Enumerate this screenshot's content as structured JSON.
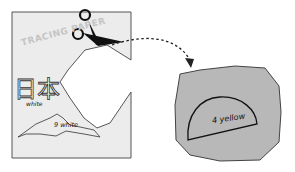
{
  "tracing_paper": {
    "label": "TRACING PAPER",
    "kanji": "日本",
    "kanji_label": "white",
    "mountain_label": "9 white"
  },
  "cut_piece": {
    "label": "4 yellow"
  },
  "colors": {
    "paper": "#ececec",
    "target_shape": "#b8b8b8",
    "outline": "#222222",
    "tracing_text": "#c4c4c4"
  }
}
